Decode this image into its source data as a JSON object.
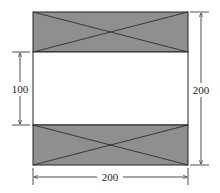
{
  "diagram": {
    "shape": "square cross-section with two shaded bands",
    "fill_color": "#8f8f8f",
    "line_color": "#222222",
    "dimensions": {
      "left_gap": "100",
      "right_height": "200",
      "bottom_width": "200"
    }
  }
}
